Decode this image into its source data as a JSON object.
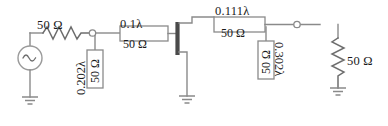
{
  "diagram": {
    "type": "schematic",
    "line_color": "#8a8a8a",
    "text_color": "#1a1a1a",
    "background": "#ffffff"
  },
  "components": {
    "source": {
      "name": "ac-voltage-source",
      "symbol": "sine-wave-circle",
      "glyph": "∿"
    },
    "series_resistor": {
      "name": "series-resistor",
      "label": "50 Ω",
      "symbol": "zigzag"
    },
    "load_resistor": {
      "name": "load-resistor",
      "label": "50 Ω",
      "symbol": "zigzag-vertical"
    },
    "stub1": {
      "name": "shunt-stub-1",
      "length_label": "0.202λ",
      "impedance_label": "50 Ω",
      "orientation": "vertical",
      "impedance_rotation": "180deg",
      "length_rotation": "90ccw"
    },
    "tline1": {
      "name": "transmission-line-1",
      "length_label": "0.1λ",
      "impedance_label": "50 Ω",
      "orientation": "horizontal"
    },
    "tline2": {
      "name": "transmission-line-2",
      "length_label": "0.111λ",
      "impedance_label": "50 Ω",
      "orientation": "horizontal"
    },
    "stub2": {
      "name": "shunt-stub-2",
      "length_label": "0.302λ",
      "impedance_label": "50 Ω",
      "orientation": "vertical",
      "impedance_rotation": "180deg",
      "length_rotation": "90cw"
    },
    "grounds": [
      {
        "name": "ground-source",
        "label": ""
      },
      {
        "name": "ground-center",
        "label": ""
      },
      {
        "name": "ground-load",
        "label": ""
      }
    ],
    "nodes": [
      {
        "name": "node-junction-1"
      },
      {
        "name": "node-junction-2"
      }
    ],
    "short_bar": {
      "name": "short-circuit-bar",
      "color": "#4a4a4a"
    }
  }
}
